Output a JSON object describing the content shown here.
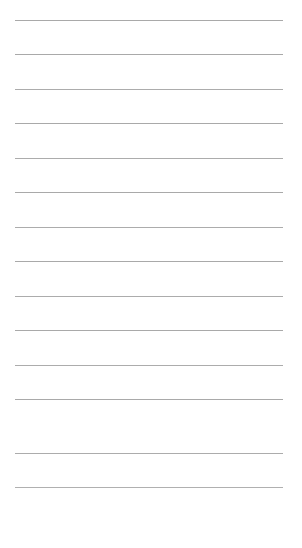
{
  "page": {
    "kind": "ruled-paper-sheet",
    "width": 302,
    "height": 548,
    "background_color": "#ffffff",
    "text_content": "",
    "has_text": false,
    "has_margin_rule": false,
    "has_header": false
  },
  "ruling": {
    "name": "horizontal-ruled-lines",
    "line_count": 14,
    "line_color": "#a9a9a9",
    "line_thickness_px": 1,
    "line_left_px": 15,
    "line_right_px": 283,
    "line_width_px": 268,
    "first_line_y_px": 20,
    "last_line_y_px": 487,
    "line_spacing_px": 34.4,
    "bottom_margin_px": 61,
    "line_y_positions": [
      20,
      54,
      89,
      123,
      158,
      192,
      227,
      261,
      296,
      330,
      365,
      399,
      453,
      487
    ],
    "lines": [
      {
        "index": 1,
        "y": 20,
        "color": "#a9a9a9"
      },
      {
        "index": 2,
        "y": 54,
        "color": "#a9a9a9"
      },
      {
        "index": 3,
        "y": 89,
        "color": "#acacac"
      },
      {
        "index": 4,
        "y": 123,
        "color": "#a9a9a9"
      },
      {
        "index": 5,
        "y": 158,
        "color": "#acacac"
      },
      {
        "index": 6,
        "y": 192,
        "color": "#a9a9a9"
      },
      {
        "index": 7,
        "y": 227,
        "color": "#acacac"
      },
      {
        "index": 8,
        "y": 261,
        "color": "#a9a9a9"
      },
      {
        "index": 9,
        "y": 296,
        "color": "#acacac"
      },
      {
        "index": 10,
        "y": 330,
        "color": "#a9a9a9"
      },
      {
        "index": 11,
        "y": 365,
        "color": "#acacac"
      },
      {
        "index": 12,
        "y": 399,
        "color": "#a9a9a9"
      },
      {
        "index": 13,
        "y": 453,
        "color": "#acacac"
      },
      {
        "index": 14,
        "y": 487,
        "color": "#b0b0b0"
      }
    ]
  }
}
